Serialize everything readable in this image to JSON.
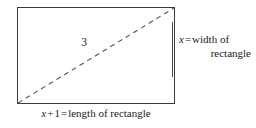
{
  "figure": {
    "type": "geometry-diagram",
    "shape": "rectangle",
    "diagonal_label": "3",
    "width_label": {
      "line1_variable": "x",
      "line1_operator": "=",
      "line1_text": "width of",
      "line2_text": "rectangle",
      "full_text": "x = width of rectangle"
    },
    "length_label": {
      "variable": "x",
      "plus_operator": "+",
      "addend": "1",
      "equals_operator": "=",
      "text": "length of rectangle",
      "full_text": "x + 1 = length of rectangle"
    },
    "colors": {
      "background": "#ffffff",
      "rectangle_stroke": "#3a3a3a",
      "diagonal_stroke": "#555555",
      "separator": "#4a4a4a",
      "text": "#1a1a1a"
    },
    "geometry": {
      "rect_left": 17,
      "rect_top": 7,
      "rect_width": 158,
      "rect_height": 97,
      "diagonal_from": "bottom-left",
      "diagonal_to": "top-right",
      "diagonal_style": "dashed"
    }
  }
}
